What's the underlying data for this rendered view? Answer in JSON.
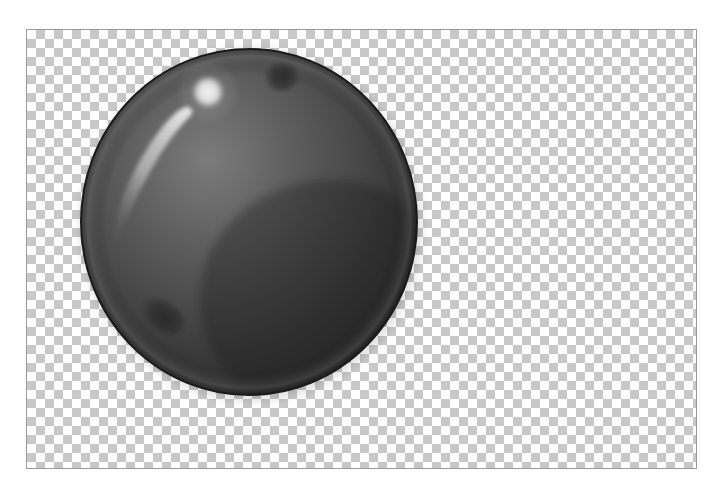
{
  "canvas": {
    "width": 725,
    "height": 489,
    "background": "#ffffff"
  },
  "transparency_grid": {
    "left": 26,
    "top": 29,
    "width": 671,
    "height": 440,
    "tile_size": 9,
    "light_color": "#ffffff",
    "dark_color": "#c8c8c8",
    "border_color": "#9a9a9a"
  },
  "sphere": {
    "description": "Glossy dark gray sphere",
    "center_x": 249,
    "center_y": 222,
    "radius_x": 168,
    "radius_y": 173,
    "outline_color": "#1a1a1a",
    "colors": {
      "highlight": "#8a8a8a",
      "mid": "#5a5a5a",
      "shadow": "#2e2e2e",
      "rim_light": "#6a6a6a"
    },
    "specular_spot": {
      "cx": 208,
      "cy": 92,
      "r": 16,
      "color": "#e6e6e6"
    },
    "crescent_highlight": {
      "color": "#d8d8d8"
    },
    "dark_spots": [
      {
        "name": "top-spot",
        "cx": 281,
        "cy": 77,
        "rx": 16,
        "ry": 14
      },
      {
        "name": "bottom-left-spot",
        "cx": 163,
        "cy": 316,
        "rx": 22,
        "ry": 15
      }
    ]
  }
}
